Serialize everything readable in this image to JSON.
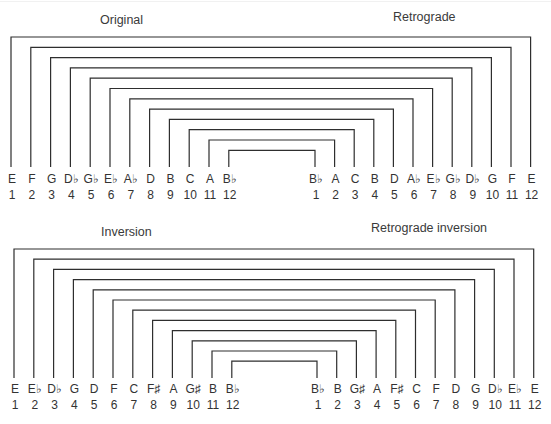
{
  "style": {
    "line_color": "#2e2e2e",
    "text_color": "#333333",
    "background": "#ffffff"
  },
  "diagrams": [
    {
      "id": "original-retrograde",
      "left_title": "Original",
      "right_title": "Retrograde",
      "left_title_pos": [
        100,
        13
      ],
      "right_title_pos": [
        393,
        10
      ],
      "left_x_start": 11,
      "left_x_step": 19.8,
      "right_x_start": 315,
      "right_x_step": 19.6,
      "top_y_start": 37,
      "top_y_step": 10.3,
      "line_bottom": 167,
      "note_y": 183,
      "num_y": 199,
      "left_notes": [
        "E",
        "F",
        "G",
        "D♭",
        "G♭",
        "E♭",
        "A♭",
        "D",
        "B",
        "C",
        "A",
        "B♭"
      ],
      "left_numbers": [
        "1",
        "2",
        "3",
        "4",
        "5",
        "6",
        "7",
        "8",
        "9",
        "10",
        "11",
        "12"
      ],
      "right_notes": [
        "B♭",
        "A",
        "C",
        "B",
        "D",
        "A♭",
        "E♭",
        "G♭",
        "D♭",
        "G",
        "F",
        "E"
      ],
      "right_numbers": [
        "1",
        "2",
        "3",
        "4",
        "5",
        "6",
        "7",
        "8",
        "9",
        "10",
        "11",
        "12"
      ]
    },
    {
      "id": "inversion-retrograde-inversion",
      "left_title": "Inversion",
      "right_title": "Retrograde inversion",
      "left_title_pos": [
        101,
        225
      ],
      "right_title_pos": [
        371,
        221
      ],
      "left_x_start": 14,
      "left_x_step": 19.8,
      "right_x_start": 317,
      "right_x_step": 19.7,
      "top_y_start": 249,
      "top_y_step": 10.2,
      "line_bottom": 378,
      "note_y": 393,
      "num_y": 409,
      "left_notes": [
        "E",
        "E♭",
        "D♭",
        "G",
        "D",
        "F",
        "C",
        "F♯",
        "A",
        "G♯",
        "B",
        "B♭"
      ],
      "left_numbers": [
        "1",
        "2",
        "3",
        "4",
        "5",
        "6",
        "7",
        "8",
        "9",
        "10",
        "11",
        "12"
      ],
      "right_notes": [
        "B♭",
        "B",
        "G♯",
        "A",
        "F♯",
        "C",
        "F",
        "D",
        "G",
        "D♭",
        "E♭",
        "E"
      ],
      "right_numbers": [
        "1",
        "2",
        "3",
        "4",
        "5",
        "6",
        "7",
        "8",
        "9",
        "10",
        "11",
        "12"
      ]
    }
  ]
}
